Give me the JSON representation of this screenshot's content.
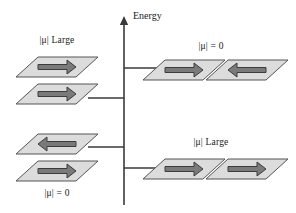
{
  "figure": {
    "axis": {
      "name": "energy-axis",
      "label": "Energy",
      "label_x": 133,
      "label_y": 10,
      "line_x": 124,
      "line_top": 18,
      "line_bottom": 205,
      "color": "#3a3a3a"
    },
    "ticks": [
      {
        "name": "tick-upper-right",
        "y": 68,
        "direction": "right",
        "x_start": 124,
        "x_end": 160
      },
      {
        "name": "tick-upper-left",
        "y": 98,
        "direction": "left",
        "x_start": 88,
        "x_end": 124
      },
      {
        "name": "tick-lower-left",
        "y": 147,
        "direction": "left",
        "x_start": 88,
        "x_end": 124
      },
      {
        "name": "tick-lower-right",
        "y": 168,
        "direction": "right",
        "x_start": 124,
        "x_end": 160
      }
    ],
    "labels": [
      {
        "name": "label-top-left",
        "text": "|μ| Large",
        "x": 57,
        "y": 35
      },
      {
        "name": "label-top-right",
        "text": "|μ| = 0",
        "x": 211,
        "y": 41
      },
      {
        "name": "label-bottom-right",
        "text": "|μ| Large",
        "x": 211,
        "y": 137
      },
      {
        "name": "label-bottom-left",
        "text": "|μ| = 0",
        "x": 57,
        "y": 188
      }
    ],
    "plates": [
      {
        "name": "plate-top-left-upper",
        "group": "top-left",
        "cx": 57,
        "cy": 67,
        "arrow": "right",
        "fill": "#dcdcdc",
        "stroke": "#555555"
      },
      {
        "name": "plate-top-left-lower",
        "group": "top-left",
        "cx": 57,
        "cy": 94,
        "arrow": "right",
        "fill": "#dcdcdc",
        "stroke": "#555555"
      },
      {
        "name": "plate-bottom-left-upper",
        "group": "bottom-left",
        "cx": 57,
        "cy": 144,
        "arrow": "left",
        "fill": "#dcdcdc",
        "stroke": "#555555"
      },
      {
        "name": "plate-bottom-left-lower",
        "group": "bottom-left",
        "cx": 57,
        "cy": 171,
        "arrow": "right",
        "fill": "#dcdcdc",
        "stroke": "#555555"
      },
      {
        "name": "plate-top-right-left",
        "group": "top-right",
        "cx": 184,
        "cy": 70,
        "arrow": "right",
        "fill": "#dcdcdc",
        "stroke": "#555555"
      },
      {
        "name": "plate-top-right-right",
        "group": "top-right",
        "cx": 247,
        "cy": 70,
        "arrow": "left",
        "fill": "#dcdcdc",
        "stroke": "#555555"
      },
      {
        "name": "plate-bottom-right-left",
        "group": "bottom-right",
        "cx": 184,
        "cy": 169,
        "arrow": "right",
        "fill": "#dcdcdc",
        "stroke": "#555555"
      },
      {
        "name": "plate-bottom-right-right",
        "group": "bottom-right",
        "cx": 247,
        "cy": 169,
        "arrow": "right",
        "fill": "#dcdcdc",
        "stroke": "#555555"
      }
    ],
    "geometry": {
      "plate_half_width": 30,
      "plate_half_height": 10,
      "plate_skew": 11,
      "arrow_half_length": 19,
      "arrow_shaft_thickness": 5,
      "arrow_head_length": 9,
      "arrow_head_half_height": 7,
      "arrow_fill": "#7a7a7a",
      "arrow_stroke": "#3c3c3c"
    },
    "colors": {
      "background": "#ffffff",
      "plate_fill": "#dcdcdc",
      "plate_stroke": "#555555",
      "arrow_fill": "#7a7a7a",
      "arrow_stroke": "#3c3c3c",
      "axis": "#3a3a3a",
      "text": "#1a1a1a"
    }
  }
}
